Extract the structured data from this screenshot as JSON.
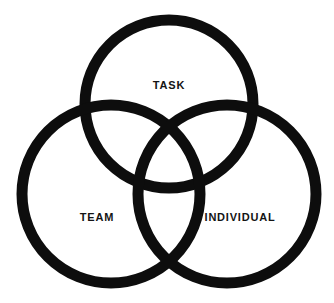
{
  "diagram": {
    "type": "venn-three-circle",
    "title": "",
    "background_color": "#ffffff",
    "stroke_color": "#0d0d0d",
    "text_color": "#141414",
    "stroke_width": 11,
    "canvas": {
      "width": 334,
      "height": 303
    },
    "sets": [
      {
        "id": "task",
        "label": "TASK",
        "position": "top",
        "center_x": 169,
        "center_y": 104,
        "radius": 84,
        "label_x": 169,
        "label_y": 85
      },
      {
        "id": "team",
        "label": "TEAM",
        "position": "bottom-left",
        "center_x": 111,
        "center_y": 194,
        "radius": 89,
        "label_x": 97,
        "label_y": 217
      },
      {
        "id": "individual",
        "label": "INDIVIDUAL",
        "position": "bottom-right",
        "center_x": 227,
        "center_y": 194,
        "radius": 89,
        "label_x": 240,
        "label_y": 217
      }
    ]
  }
}
